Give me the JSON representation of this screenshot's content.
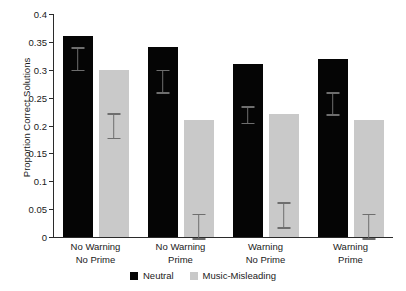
{
  "chart_data": {
    "type": "bar",
    "title": "",
    "xlabel": "",
    "ylabel": "Proportion Correct Solutions",
    "ylim": [
      0,
      0.4
    ],
    "yticks": [
      "0",
      "0.05",
      "0.1",
      "0.15",
      "0.2",
      "0.25",
      "0.3",
      "0.35",
      "0.4"
    ],
    "ytick_values": [
      0,
      0.05,
      0.1,
      0.15,
      0.2,
      0.25,
      0.3,
      0.35,
      0.4
    ],
    "grid": false,
    "legend_position": "bottom-center",
    "categories": [
      "No Warning\nNo Prime",
      "No Warning\nPrime",
      "Warning\nNo Prime",
      "Warning\nPrime"
    ],
    "category_lines": [
      [
        "No Warning",
        "No Prime"
      ],
      [
        "No Warning",
        "Prime"
      ],
      [
        "Warning",
        "No Prime"
      ],
      [
        "Warning",
        "Prime"
      ]
    ],
    "series": [
      {
        "name": "Neutral",
        "color": "#050505",
        "values": [
          0.36,
          0.34,
          0.31,
          0.32
        ],
        "errors": [
          0.02,
          0.02,
          0.015,
          0.02
        ]
      },
      {
        "name": "Music-Misleading",
        "color": "#c9c9c9",
        "values": [
          0.3,
          0.21,
          0.22,
          0.21
        ],
        "errors": [
          0.022,
          0.022,
          0.022,
          0.022
        ]
      }
    ]
  },
  "legend": {
    "items": [
      {
        "label": "Neutral",
        "color": "#050505"
      },
      {
        "label": "Music-Misleading",
        "color": "#c9c9c9"
      }
    ]
  },
  "axis": {
    "y_title": "Proportion Correct Solutions"
  }
}
